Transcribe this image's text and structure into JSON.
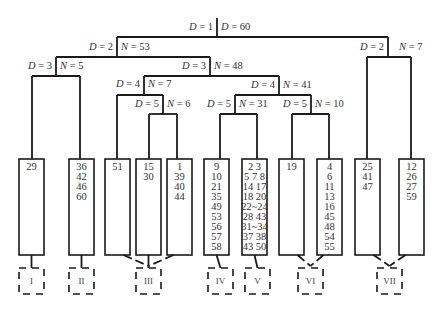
{
  "diagram": {
    "type": "cluster-dendrogram",
    "nodes": [
      {
        "id": "root",
        "left": "D = 1",
        "right": "D = 60"
      },
      {
        "id": "n2a",
        "left": "D = 2",
        "right": "N = 53"
      },
      {
        "id": "n2b",
        "left": "D = 2",
        "right": "N = 7"
      },
      {
        "id": "n3a",
        "left": "D = 3",
        "right": "N = 5"
      },
      {
        "id": "n3b",
        "left": "D = 3",
        "right": "N = 48"
      },
      {
        "id": "n4a",
        "left": "D = 4",
        "right": "N = 7"
      },
      {
        "id": "n4b",
        "left": "D = 4",
        "right": "N = 41"
      },
      {
        "id": "n5a",
        "left": "D = 5",
        "right": "N = 6"
      },
      {
        "id": "n5b",
        "left": "D = 5",
        "right": "N = 31"
      },
      {
        "id": "n5c",
        "left": "D = 5",
        "right": "N = 10"
      }
    ],
    "leaves": [
      {
        "items": [
          "29"
        ],
        "group": "I"
      },
      {
        "items": [
          "36",
          "42",
          "46",
          "60"
        ],
        "group": "II"
      },
      {
        "items": [
          "51"
        ],
        "group": "III"
      },
      {
        "items": [
          "15",
          "30"
        ],
        "group": "III"
      },
      {
        "items": [
          "1",
          "39",
          "40",
          "44"
        ],
        "group": "III"
      },
      {
        "items": [
          "9",
          "10",
          "21",
          "35",
          "49",
          "53",
          "56",
          "57",
          "58"
        ],
        "group": "IV"
      },
      {
        "items": [
          "2  3",
          "5  7  8",
          "14  17",
          "18  20",
          "22~24",
          "28  43",
          "31~34",
          "37  38",
          "43  50"
        ],
        "group": "V"
      },
      {
        "items": [
          "19"
        ],
        "group": "VI"
      },
      {
        "items": [
          "4",
          "6",
          "11",
          "13",
          "16",
          "45",
          "48",
          "54",
          "55"
        ],
        "group": "VI"
      },
      {
        "items": [
          "25",
          "41",
          "47"
        ],
        "group": "VII"
      },
      {
        "items": [
          "12",
          "26",
          "27",
          "59"
        ],
        "group": "VII"
      }
    ],
    "groups": [
      "I",
      "II",
      "III",
      "IV",
      "V",
      "VI",
      "VII"
    ]
  }
}
